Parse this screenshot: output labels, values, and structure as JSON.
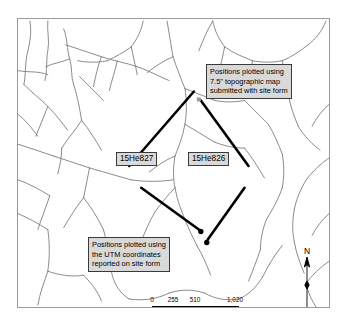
{
  "map": {
    "title": "Archaeological site location map",
    "frame": {
      "border_color": "#9a9a9a",
      "background": "#ffffff"
    },
    "stream_color": "#7d7d7d",
    "leader_color": "#000000",
    "callouts": [
      {
        "name": "topo-callout",
        "lines": [
          "Positions plotted using",
          "7.5\" topographic map",
          "submitted with site form"
        ]
      },
      {
        "name": "utm-callout",
        "lines": [
          "Positions plotted using",
          "the UTM coordinates",
          "reported on site form"
        ]
      }
    ],
    "site_labels": [
      {
        "name": "site-label-left",
        "text": "15He827"
      },
      {
        "name": "site-label-right",
        "text": "15He826"
      }
    ],
    "north_arrow": {
      "letter": "N"
    },
    "scalebar": {
      "ticks": [
        "0",
        "255",
        "510",
        "1,020"
      ],
      "units": "Meters"
    }
  }
}
